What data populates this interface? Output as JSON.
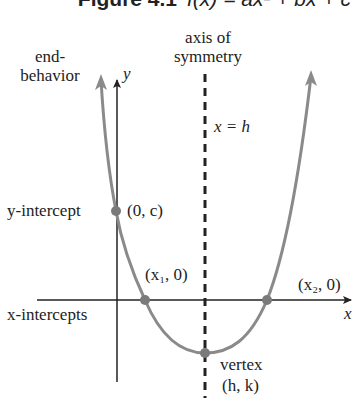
{
  "figure": {
    "label": "Figure 4.1",
    "equation": "f(x) = ax² + bx + c"
  },
  "labels": {
    "axis_of_symmetry_line1": "axis of",
    "axis_of_symmetry_line2": "symmetry",
    "end_behavior_line1": "end-",
    "end_behavior_line2": "behavior",
    "y_axis": "y",
    "x_axis": "x",
    "symmetry_equation": "x = h",
    "y_intercept": "y-intercept",
    "y_intercept_point": "(0, c)",
    "x1_point": "(x₁, 0)",
    "x2_point": "(x₂, 0)",
    "x_intercepts": "x-intercepts",
    "vertex": "vertex",
    "vertex_point": "(h, k)"
  },
  "colors": {
    "curve": "#8a8a8a",
    "axes": "#222222",
    "points": "#7a7a7a",
    "dashed_line": "#222222"
  }
}
